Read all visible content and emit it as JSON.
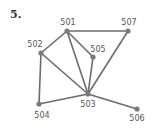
{
  "problem_number": "5.",
  "graph": {
    "nodes": [
      {
        "id": "501",
        "x": 67,
        "y": 31,
        "lx": 68,
        "ly": 25
      },
      {
        "id": "502",
        "x": 41,
        "y": 53,
        "lx": 35,
        "ly": 47
      },
      {
        "id": "503",
        "x": 88,
        "y": 94,
        "lx": 88,
        "ly": 107
      },
      {
        "id": "504",
        "x": 39,
        "y": 104,
        "lx": 42,
        "ly": 118
      },
      {
        "id": "505",
        "x": 93,
        "y": 57,
        "lx": 98,
        "ly": 52
      },
      {
        "id": "506",
        "x": 137,
        "y": 109,
        "lx": 137,
        "ly": 121
      },
      {
        "id": "507",
        "x": 128,
        "y": 31,
        "lx": 129,
        "ly": 25
      }
    ],
    "edges": [
      [
        "501",
        "507"
      ],
      [
        "501",
        "502"
      ],
      [
        "501",
        "505"
      ],
      [
        "501",
        "503"
      ],
      [
        "502",
        "503"
      ],
      [
        "502",
        "504"
      ],
      [
        "505",
        "503"
      ],
      [
        "507",
        "503"
      ],
      [
        "504",
        "503"
      ],
      [
        "503",
        "506"
      ]
    ]
  }
}
